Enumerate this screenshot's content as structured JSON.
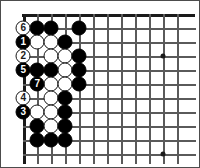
{
  "diagram": {
    "kind": "go-board-corner-problem",
    "board": {
      "cols": 12,
      "rows": 10,
      "cell": 14,
      "origin_x": 23,
      "origin_y": 28,
      "top_edge_y": 14,
      "left_edge_x": 23,
      "line_color": "#5a5a5a",
      "edge_color": "#1a1a1a",
      "background_color": "#ffffff"
    },
    "star_points": [
      {
        "col": 11,
        "row": 3,
        "name": "star-point-upper-right"
      },
      {
        "col": 11,
        "row": 10,
        "name": "star-point-lower-right"
      }
    ],
    "stones": [
      {
        "col": 1,
        "row": 1,
        "color": "white",
        "label": "6",
        "marked": true
      },
      {
        "col": 2,
        "row": 1,
        "color": "black",
        "label": "",
        "marked": false
      },
      {
        "col": 3,
        "row": 1,
        "color": "black",
        "label": "",
        "marked": false
      },
      {
        "col": 5,
        "row": 1,
        "color": "black",
        "label": "",
        "marked": false
      },
      {
        "col": 1,
        "row": 2,
        "color": "black",
        "label": "1",
        "marked": true
      },
      {
        "col": 2,
        "row": 2,
        "color": "white",
        "label": "",
        "marked": false
      },
      {
        "col": 3,
        "row": 2,
        "color": "white",
        "label": "",
        "marked": false
      },
      {
        "col": 4,
        "row": 2,
        "color": "black",
        "label": "",
        "marked": false
      },
      {
        "col": 1,
        "row": 3,
        "color": "white",
        "label": "2",
        "marked": true
      },
      {
        "col": 3,
        "row": 3,
        "color": "white",
        "label": "",
        "marked": false
      },
      {
        "col": 4,
        "row": 3,
        "color": "white",
        "label": "",
        "marked": false
      },
      {
        "col": 5,
        "row": 3,
        "color": "black",
        "label": "",
        "marked": false
      },
      {
        "col": 1,
        "row": 4,
        "color": "black",
        "label": "5",
        "marked": true
      },
      {
        "col": 2,
        "row": 4,
        "color": "black",
        "label": "",
        "marked": false
      },
      {
        "col": 3,
        "row": 4,
        "color": "black",
        "label": "",
        "marked": false
      },
      {
        "col": 4,
        "row": 4,
        "color": "white",
        "label": "",
        "marked": false
      },
      {
        "col": 5,
        "row": 4,
        "color": "black",
        "label": "",
        "marked": false
      },
      {
        "col": 2,
        "row": 5,
        "color": "black",
        "label": "7",
        "marked": true
      },
      {
        "col": 3,
        "row": 5,
        "color": "white",
        "label": "",
        "marked": false
      },
      {
        "col": 4,
        "row": 5,
        "color": "white",
        "label": "",
        "marked": false
      },
      {
        "col": 5,
        "row": 5,
        "color": "black",
        "label": "",
        "marked": false
      },
      {
        "col": 1,
        "row": 6,
        "color": "white",
        "label": "4",
        "marked": true
      },
      {
        "col": 3,
        "row": 6,
        "color": "white",
        "label": "",
        "marked": false
      },
      {
        "col": 4,
        "row": 6,
        "color": "black",
        "label": "",
        "marked": false
      },
      {
        "col": 1,
        "row": 7,
        "color": "black",
        "label": "3",
        "marked": true
      },
      {
        "col": 2,
        "row": 7,
        "color": "white",
        "label": "",
        "marked": false
      },
      {
        "col": 3,
        "row": 7,
        "color": "white",
        "label": "",
        "marked": false
      },
      {
        "col": 4,
        "row": 7,
        "color": "black",
        "label": "",
        "marked": false
      },
      {
        "col": 2,
        "row": 8,
        "color": "black",
        "label": "",
        "marked": false
      },
      {
        "col": 3,
        "row": 8,
        "color": "white",
        "label": "",
        "marked": false
      },
      {
        "col": 4,
        "row": 8,
        "color": "black",
        "label": "",
        "marked": false
      },
      {
        "col": 2,
        "row": 9,
        "color": "black",
        "label": "",
        "marked": false
      },
      {
        "col": 3,
        "row": 9,
        "color": "black",
        "label": "",
        "marked": false
      },
      {
        "col": 4,
        "row": 9,
        "color": "black",
        "label": "",
        "marked": false
      }
    ],
    "move_sequence": [
      "1",
      "2",
      "3",
      "4",
      "5",
      "6",
      "7"
    ]
  }
}
